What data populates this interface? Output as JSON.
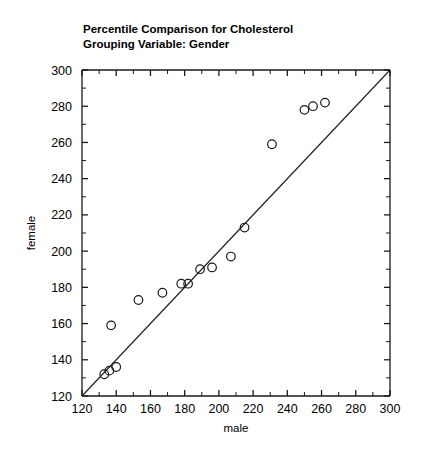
{
  "chart_data": {
    "type": "scatter",
    "title": "Percentile Comparison for Cholesterol",
    "subtitle": "Grouping Variable: Gender",
    "xlabel": "male",
    "ylabel": "female",
    "xlim": [
      120,
      300
    ],
    "ylim": [
      120,
      300
    ],
    "xticks": [
      120,
      140,
      160,
      180,
      200,
      220,
      240,
      260,
      280,
      300
    ],
    "yticks": [
      120,
      140,
      160,
      180,
      200,
      220,
      240,
      260,
      280,
      300
    ],
    "minor_tick_step": 10,
    "grid": false,
    "legend": null,
    "marker": "open-circle",
    "marker_color": "#1a1a1a",
    "reference_line": {
      "label": "y = x identity line",
      "from": [
        120,
        120
      ],
      "to": [
        300,
        300
      ],
      "color": "#222222"
    },
    "points": [
      {
        "x": 133,
        "y": 132
      },
      {
        "x": 136,
        "y": 134
      },
      {
        "x": 140,
        "y": 136
      },
      {
        "x": 137,
        "y": 159
      },
      {
        "x": 153,
        "y": 173
      },
      {
        "x": 167,
        "y": 177
      },
      {
        "x": 178,
        "y": 182
      },
      {
        "x": 182,
        "y": 182
      },
      {
        "x": 189,
        "y": 190
      },
      {
        "x": 196,
        "y": 191
      },
      {
        "x": 207,
        "y": 197
      },
      {
        "x": 215,
        "y": 213
      },
      {
        "x": 231,
        "y": 259
      },
      {
        "x": 250,
        "y": 278
      },
      {
        "x": 255,
        "y": 280
      },
      {
        "x": 262,
        "y": 282
      }
    ]
  }
}
